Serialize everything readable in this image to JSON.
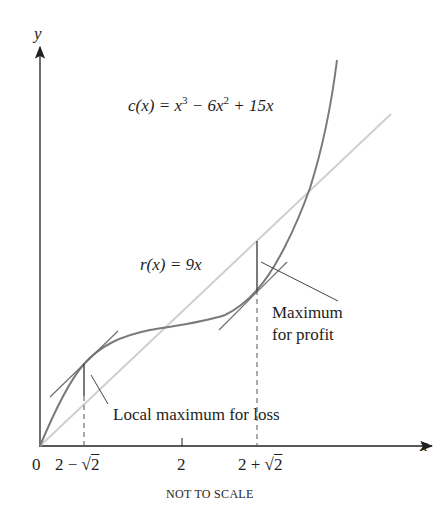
{
  "diagram": {
    "axes": {
      "x_label": "x",
      "y_label": "y",
      "origin_label": "0",
      "ticks": [
        {
          "label_pre": "2 − √",
          "label_rad": "2",
          "value": "2 - sqrt(2)"
        },
        {
          "label": "2",
          "value": "2"
        },
        {
          "label_pre": "2 + √",
          "label_rad": "2",
          "value": "2 + sqrt(2)"
        }
      ],
      "footnote": "NOT TO SCALE"
    },
    "curves": {
      "cost": {
        "name": "c(x)",
        "label_lhs": "c(x) = x",
        "label_exp1": "3",
        "label_mid": " − 6x",
        "label_exp2": "2",
        "label_rhs": " + 15x",
        "color": "#7a7a7a"
      },
      "revenue": {
        "name": "r(x)",
        "label": "r(x) = 9x",
        "color": "#cfcfcf"
      }
    },
    "annotations": {
      "loss": "Local maximum for loss",
      "profit_line1": "Maximum",
      "profit_line2": "for profit"
    },
    "colors": {
      "axis": "#222222",
      "cost_curve": "#7a7a7a",
      "revenue_line": "#cfcfcf",
      "tangent": "#6e6e6e"
    }
  }
}
